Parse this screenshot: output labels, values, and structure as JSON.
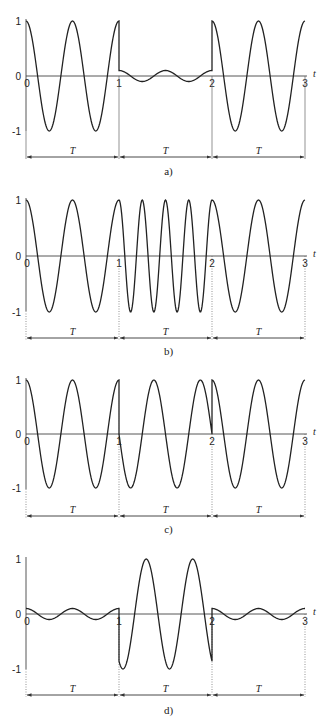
{
  "figure": {
    "panels": [
      {
        "id": "a",
        "caption": "a)",
        "y_top": 21,
        "y_zero": 76,
        "y_bottom": 131,
        "arrow_y": 157,
        "caption_y": 175,
        "guide_style": "solid",
        "segments": [
          {
            "t0": 0,
            "t1": 1,
            "amp": 1,
            "freq": 2,
            "phase": 0
          },
          {
            "t0": 1,
            "t1": 2,
            "amp": 0.1,
            "freq": 2,
            "phase": 0
          },
          {
            "t0": 2,
            "t1": 3,
            "amp": 1,
            "freq": 2,
            "phase": 0
          }
        ]
      },
      {
        "id": "b",
        "caption": "b)",
        "y_top": 200,
        "y_zero": 256,
        "y_bottom": 311,
        "arrow_y": 338,
        "caption_y": 355,
        "guide_style": "dotted",
        "segments": [
          {
            "t0": 0,
            "t1": 1,
            "amp": 1,
            "freq": 2,
            "phase": 0
          },
          {
            "t0": 1,
            "t1": 2,
            "amp": 1,
            "freq": 4,
            "phase": 0
          },
          {
            "t0": 2,
            "t1": 3,
            "amp": 1,
            "freq": 2,
            "phase": 0
          }
        ]
      },
      {
        "id": "c",
        "caption": "c)",
        "y_top": 380,
        "y_zero": 434,
        "y_bottom": 489,
        "arrow_y": 516,
        "caption_y": 533,
        "guide_style": "dotted",
        "segments": [
          {
            "t0": 0,
            "t1": 1,
            "amp": 1,
            "freq": 2,
            "phase": 0
          },
          {
            "t0": 1,
            "t1": 2,
            "amp": 1,
            "freq": 2,
            "phase": 1.5708
          },
          {
            "t0": 2,
            "t1": 3,
            "amp": 1,
            "freq": 2,
            "phase": 0
          }
        ]
      },
      {
        "id": "d",
        "caption": "d)",
        "y_top": 559,
        "y_zero": 614,
        "y_bottom": 669,
        "arrow_y": 695,
        "caption_y": 714,
        "guide_style": "dotted",
        "segments": [
          {
            "t0": 0,
            "t1": 1,
            "amp": 0.1,
            "freq": 2,
            "phase": 0
          },
          {
            "t0": 1,
            "t1": 2,
            "amp": 1,
            "freq": 2,
            "phase": 2.6
          },
          {
            "t0": 2,
            "t1": 3,
            "amp": 0.1,
            "freq": 2,
            "phase": 0
          }
        ]
      }
    ],
    "x_pixels": [
      26,
      119,
      212,
      305
    ],
    "x_ticks": [
      "0",
      "1",
      "2",
      "3"
    ],
    "y_ticks": [
      "1",
      "0",
      "-1"
    ],
    "axis_label": "t",
    "interval_label": "T"
  }
}
